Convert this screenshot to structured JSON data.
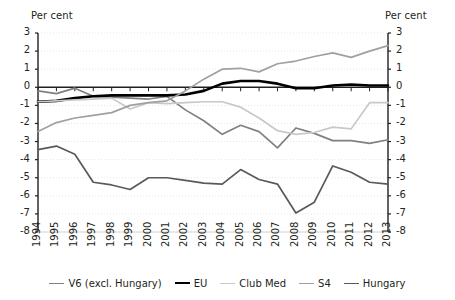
{
  "axes": {
    "unit_label_left": "Per cent",
    "unit_label_right": "Per cent",
    "y_ticks": [
      3,
      2,
      1,
      0,
      -1,
      -2,
      -3,
      -4,
      -5,
      -6,
      -7,
      -8
    ],
    "x_ticks": [
      "1994",
      "1995",
      "1996",
      "1997",
      "1998",
      "1999",
      "2000",
      "2001",
      "2002",
      "2003",
      "2004",
      "2005",
      "2006",
      "2007",
      "2008",
      "2009",
      "2010",
      "2011",
      "2012",
      "2013"
    ]
  },
  "legend": {
    "position": "bottom",
    "items": [
      {
        "label": "V6 (excl. Hungary)",
        "color": "#808080"
      },
      {
        "label": "EU",
        "color": "#000000"
      },
      {
        "label": "Club Med",
        "color": "#c8c8c8"
      },
      {
        "label": "S4",
        "color": "#a0a0a0"
      },
      {
        "label": "Hungary",
        "color": "#595959"
      }
    ]
  },
  "chart_data": {
    "type": "line",
    "title": "",
    "xlabel": "",
    "ylabel": "Per cent",
    "ylim": [
      -8,
      3
    ],
    "grid": true,
    "x": [
      "1994",
      "1995",
      "1996",
      "1997",
      "1998",
      "1999",
      "2000",
      "2001",
      "2002",
      "2003",
      "2004",
      "2005",
      "2006",
      "2007",
      "2008",
      "2009",
      "2010",
      "2011",
      "2012",
      "2013"
    ],
    "series": [
      {
        "name": "V6 (excl. Hungary)",
        "color": "#808080",
        "values": [
          -0.2,
          -0.35,
          -0.05,
          -0.5,
          -0.55,
          -0.6,
          -0.65,
          -0.5,
          -1.25,
          -1.85,
          -2.6,
          -2.1,
          -2.45,
          -3.35,
          -2.25,
          -2.55,
          -2.95,
          -2.95,
          -3.1,
          -2.9
        ]
      },
      {
        "name": "EU",
        "color": "#000000",
        "values": [
          -0.8,
          -0.75,
          -0.6,
          -0.5,
          -0.45,
          -0.45,
          -0.45,
          -0.45,
          -0.4,
          -0.2,
          0.2,
          0.35,
          0.35,
          0.2,
          -0.05,
          -0.05,
          0.1,
          0.15,
          0.1,
          0.1
        ]
      },
      {
        "name": "Club Med",
        "color": "#c8c8c8",
        "values": [
          -0.8,
          -0.75,
          -0.7,
          -0.65,
          -0.6,
          -1.2,
          -0.85,
          -0.9,
          -0.85,
          -0.8,
          -0.8,
          -1.1,
          -1.7,
          -2.4,
          -2.6,
          -2.5,
          -2.2,
          -2.3,
          -0.85,
          -0.85
        ]
      },
      {
        "name": "S4",
        "color": "#a0a0a0",
        "values": [
          -2.45,
          -1.95,
          -1.7,
          -1.55,
          -1.4,
          -1.0,
          -0.85,
          -0.75,
          -0.2,
          0.45,
          1.0,
          1.05,
          0.85,
          1.3,
          1.45,
          1.7,
          1.9,
          1.65,
          2.0,
          2.3
        ]
      },
      {
        "name": "Hungary",
        "color": "#595959",
        "values": [
          -3.45,
          -3.25,
          -3.7,
          -5.25,
          -5.4,
          -5.65,
          -5.0,
          -5.0,
          -5.15,
          -5.3,
          -5.35,
          -4.55,
          -5.1,
          -5.35,
          -6.95,
          -6.35,
          -4.35,
          -4.7,
          -5.25,
          -5.35
        ]
      }
    ]
  }
}
